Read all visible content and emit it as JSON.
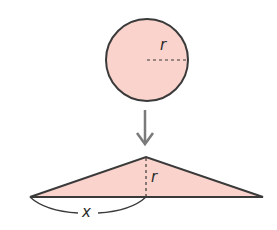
{
  "diagram": {
    "colors": {
      "fill": "#f9d3cc",
      "stroke": "#3a3a3a",
      "arrow": "#7a7a7a",
      "dash": "#3a3a3a"
    },
    "circle": {
      "radius_label": "r"
    },
    "arrow": {
      "direction": "down"
    },
    "triangle": {
      "height_label": "r",
      "half_base_label": "x"
    }
  }
}
